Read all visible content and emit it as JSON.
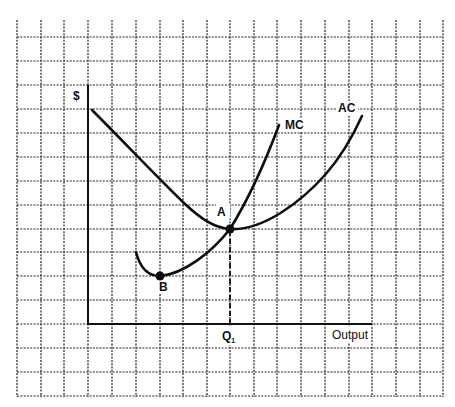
{
  "diagram": {
    "type": "cost-curves",
    "y_axis_label": "$",
    "x_axis_label": "Output",
    "x_marker_label": "Q",
    "x_marker_subscript": "1",
    "curves": [
      {
        "name": "AC",
        "label": "AC",
        "description": "Average cost, U-shaped, minimum at A"
      },
      {
        "name": "MC",
        "label": "MC",
        "description": "Marginal cost, minimum at B, crosses AC at its minimum A"
      }
    ],
    "points": [
      {
        "name": "A",
        "label": "A",
        "description": "Intersection of MC and AC (minimum of AC)"
      },
      {
        "name": "B",
        "label": "B",
        "description": "Minimum of MC"
      }
    ],
    "colors": {
      "background": "#ffffff",
      "ink": "#111111",
      "grid": "#222222"
    }
  }
}
